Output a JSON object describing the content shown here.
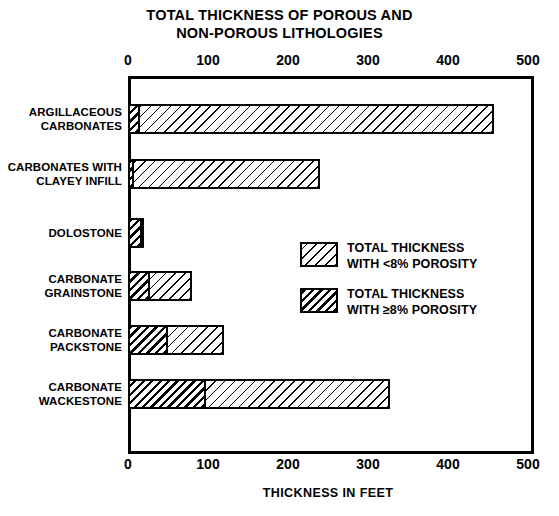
{
  "chart_data": {
    "type": "bar",
    "orientation": "horizontal",
    "title": "TOTAL THICKNESS OF POROUS AND NON-POROUS LITHOLOGIES",
    "title_lines": [
      "TOTAL THICKNESS OF POROUS AND",
      "NON-POROUS LITHOLOGIES"
    ],
    "xlabel": "THICKNESS IN FEET",
    "ylabel": "",
    "xlim": [
      0,
      500
    ],
    "xticks": [
      0,
      100,
      200,
      300,
      400,
      500
    ],
    "xtick_labels": [
      "0",
      "100",
      "200",
      "300",
      "400",
      "500"
    ],
    "axis_top_duplicate": true,
    "grid": false,
    "stacked": true,
    "categories": [
      "ARGILLACEOUS CARBONATES",
      "CARBONATES WITH CLAYEY INFILL",
      "DOLOSTONE",
      "CARBONATE GRAINSTONE",
      "CARBONATE PACKSTONE",
      "CARBONATE WACKESTONE"
    ],
    "category_lines": [
      [
        "ARGILLACEOUS",
        "CARBONATES"
      ],
      [
        "CARBONATES WITH",
        "CLAYEY INFILL"
      ],
      [
        "DOLOSTONE"
      ],
      [
        "CARBONATE",
        "GRAINSTONE"
      ],
      [
        "CARBONATE",
        "PACKSTONE"
      ],
      [
        "CARBONATE",
        "WACKESTONE"
      ]
    ],
    "series": [
      {
        "name": "TOTAL THICKNESS WITH >=8% POROSITY",
        "pattern": "dense-hatch",
        "values": [
          15,
          8,
          18,
          28,
          50,
          98
        ]
      },
      {
        "name": "TOTAL THICKNESS WITH <8% POROSITY",
        "pattern": "sparse-hatch",
        "values": [
          443,
          232,
          2,
          52,
          70,
          230
        ]
      }
    ],
    "totals": [
      458,
      240,
      20,
      80,
      120,
      328
    ],
    "legend": {
      "position": "center-right-inside",
      "entries": [
        {
          "label": "TOTAL THICKNESS WITH <8% POROSITY",
          "lines": [
            "TOTAL THICKNESS",
            "WITH <8% POROSITY"
          ],
          "pattern": "sparse-hatch"
        },
        {
          "label": "TOTAL THICKNESS WITH ≥8% POROSITY",
          "lines": [
            "TOTAL THICKNESS",
            "WITH ≥8% POROSITY"
          ],
          "pattern": "dense-hatch"
        }
      ]
    },
    "colors": {
      "ink": "#000000",
      "background": "#ffffff"
    }
  }
}
